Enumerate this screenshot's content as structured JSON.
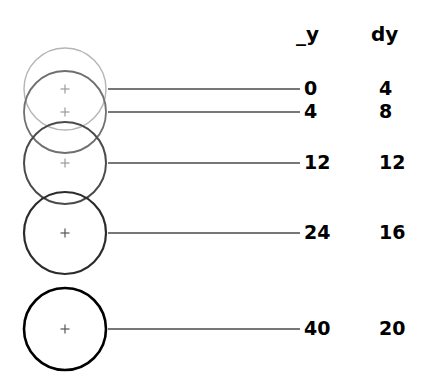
{
  "figure": {
    "title": "",
    "columns": {
      "y_header": "_y",
      "dy_header": "dy"
    },
    "rows": [
      {
        "y": "0",
        "dy": "4",
        "circle_color": "#b5b5b5",
        "cy": 89,
        "stroke": 1.4
      },
      {
        "y": "4",
        "dy": "8",
        "circle_color": "#6f6f6f",
        "cy": 112,
        "stroke": 1.8
      },
      {
        "y": "12",
        "dy": "12",
        "circle_color": "#4a4a4a",
        "cy": 163,
        "stroke": 2.0
      },
      {
        "y": "24",
        "dy": "16",
        "circle_color": "#2b2b2b",
        "cy": 233,
        "stroke": 2.2
      },
      {
        "y": "40",
        "dy": "20",
        "circle_color": "#000000",
        "cy": 329,
        "stroke": 2.6
      }
    ],
    "geometry": {
      "circle_center_x": 65,
      "circle_radius": 41,
      "leader_line_end_x": 300,
      "marker_size": 9,
      "marker_color": "#9a9a9a",
      "leader_line_color": "#4a4a4a"
    }
  },
  "chart_data": {
    "type": "scatter",
    "xlabel": "",
    "ylabel": "_y",
    "grid": false,
    "legend": null,
    "categories": [
      "0",
      "4",
      "12",
      "24",
      "40"
    ],
    "series": [
      {
        "name": "_y",
        "values": [
          0,
          4,
          12,
          24,
          40
        ]
      },
      {
        "name": "dy",
        "values": [
          4,
          8,
          12,
          16,
          20
        ]
      }
    ],
    "annotations": [
      "Five equal-radius circles mark successive positions of a body.",
      "Each circle is drawn progressively darker from top to bottom.",
      "Leader lines connect each circle centre to its _y and dy values.",
      "_y values: 0, 4, 12, 24, 40",
      "dy values: 4, 8, 12, 16, 20 (constant second difference of 4)"
    ],
    "ylim": [
      0,
      40
    ]
  }
}
